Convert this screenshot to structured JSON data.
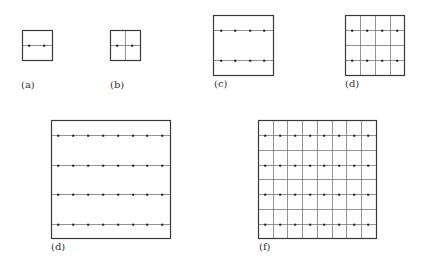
{
  "figure": {
    "stroke_color": "#3a3a3a",
    "grid_color": "#777777",
    "dot_color": "#1a1a1a",
    "panels": [
      {
        "id": "a",
        "label": "(a)",
        "box": {
          "x": 22,
          "y": 30,
          "w": 30,
          "h": 30
        },
        "h_lines": [
          45
        ],
        "v_lines": [],
        "dots": {
          "xs": [
            29,
            44
          ],
          "ys": [
            45
          ]
        },
        "label_pos": {
          "x": 21,
          "y": 79
        }
      },
      {
        "id": "b",
        "label": "(b)",
        "box": {
          "x": 110,
          "y": 30,
          "w": 30,
          "h": 30
        },
        "h_lines": [
          45
        ],
        "v_lines": [
          125
        ],
        "dots": {
          "xs": [
            117,
            132
          ],
          "ys": [
            45
          ]
        },
        "label_pos": {
          "x": 110,
          "y": 79
        }
      },
      {
        "id": "c",
        "label": "(c)",
        "box": {
          "x": 213,
          "y": 15,
          "w": 60,
          "h": 60
        },
        "h_lines": [
          30,
          60
        ],
        "v_lines": [],
        "dots": {
          "xs": [
            221,
            235,
            250,
            264
          ],
          "ys": [
            30,
            60
          ]
        },
        "label_pos": {
          "x": 214,
          "y": 78
        }
      },
      {
        "id": "d",
        "label": "(d)",
        "box": {
          "x": 345,
          "y": 15,
          "w": 59,
          "h": 60
        },
        "h_lines": [
          30,
          45,
          60
        ],
        "v_lines": [
          360,
          375,
          390
        ],
        "dots": {
          "xs": [
            352,
            367,
            382,
            397
          ],
          "ys": [
            30,
            60
          ]
        },
        "label_pos": {
          "x": 345,
          "y": 78
        }
      },
      {
        "id": "e",
        "label": "(d)",
        "box": {
          "x": 51,
          "y": 120,
          "w": 119,
          "h": 118
        },
        "h_lines": [
          135,
          165,
          194,
          224
        ],
        "v_lines": [],
        "dots": {
          "xs": [
            58,
            73,
            88,
            103,
            118,
            133,
            147,
            162
          ],
          "ys": [
            135,
            165,
            194,
            224
          ]
        },
        "label_pos": {
          "x": 51,
          "y": 241
        }
      },
      {
        "id": "f",
        "label": "(f)",
        "box": {
          "x": 258,
          "y": 120,
          "w": 118,
          "h": 118
        },
        "h_lines": [
          135,
          150,
          165,
          179,
          194,
          209,
          224
        ],
        "v_lines": [
          273,
          287,
          302,
          317,
          332,
          346,
          361
        ],
        "dots": {
          "xs": [
            265,
            280,
            295,
            310,
            324,
            339,
            354,
            368
          ],
          "ys": [
            135,
            165,
            194,
            224
          ]
        },
        "label_pos": {
          "x": 259,
          "y": 241
        }
      }
    ]
  }
}
